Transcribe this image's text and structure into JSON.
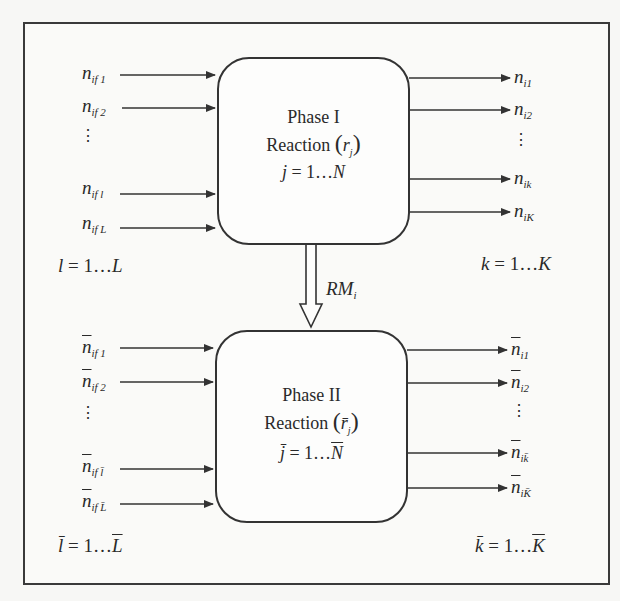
{
  "diagram": {
    "type": "two-phase reaction block diagram",
    "phase1": {
      "title": "Phase I",
      "reaction_label": "Reaction",
      "reaction_symbol": "r",
      "reaction_subscript": "j",
      "index_range": "j = 1…N",
      "index_var": "j",
      "index_eq": "= 1…",
      "index_end": "N",
      "inputs": [
        {
          "base": "n",
          "sub": "if 1"
        },
        {
          "base": "n",
          "sub": "if 2"
        },
        {
          "base": "n",
          "sub": "if l"
        },
        {
          "base": "n",
          "sub": "if L"
        }
      ],
      "outputs": [
        {
          "base": "n",
          "sub": "i1"
        },
        {
          "base": "n",
          "sub": "i2"
        },
        {
          "base": "n",
          "sub": "ik"
        },
        {
          "base": "n",
          "sub": "iK"
        }
      ],
      "input_range": {
        "var": "l",
        "eq": "= 1…",
        "end": "L"
      },
      "output_range": {
        "var": "k",
        "eq": "= 1…",
        "end": "K"
      }
    },
    "transfer": {
      "label_base": "RM",
      "label_sub": "i"
    },
    "phase2": {
      "title": "Phase II",
      "reaction_label": "Reaction",
      "reaction_symbol": "r̄",
      "reaction_subscript": "j",
      "index_var": "j̄",
      "index_eq": "= 1…",
      "index_end": "N",
      "inputs": [
        {
          "base": "n",
          "sub": "if 1"
        },
        {
          "base": "n",
          "sub": "if 2"
        },
        {
          "base": "n",
          "sub": "if l̄"
        },
        {
          "base": "n",
          "sub": "if L̄"
        }
      ],
      "outputs": [
        {
          "base": "n",
          "sub": "i1"
        },
        {
          "base": "n",
          "sub": "i2"
        },
        {
          "base": "n",
          "sub": "ik̄"
        },
        {
          "base": "n",
          "sub": "iK̄"
        }
      ],
      "input_range": {
        "var": "l̄",
        "eq": "= 1…",
        "end": "L"
      },
      "output_range": {
        "var": "k̄",
        "eq": "= 1…",
        "end": "K"
      }
    },
    "ellipsis": "⋮",
    "colors": {
      "line": "#333333",
      "background": "#fafaf8",
      "text": "#2a2a2a"
    }
  }
}
